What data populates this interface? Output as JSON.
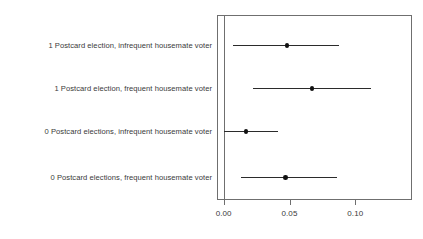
{
  "chart_data": {
    "type": "scatter",
    "title": "",
    "subtitle": "",
    "xlabel": "",
    "ylabel": "",
    "xlim": [
      -0.0051,
      0.1431
    ],
    "grid": false,
    "legend": null,
    "orientation": "horizontal",
    "x_ticks": [
      0.0,
      0.05,
      0.1
    ],
    "x_tick_labels": [
      "0.00",
      "0.05",
      "0.10"
    ],
    "reference_line": 0.0,
    "categories": [
      "1 Postcard election, infrequent housemate voter",
      "1 Postcard election, frequent housemate voter",
      "0 Postcard elections, infrequent housemate voter",
      "0 Postcard elections, frequent housemate voter"
    ],
    "points": [
      {
        "label": "1 Postcard election, infrequent housemate voter",
        "estimate": 0.048,
        "ci_low": 0.007,
        "ci_high": 0.088
      },
      {
        "label": "1 Postcard election, frequent housemate voter",
        "estimate": 0.067,
        "ci_low": 0.022,
        "ci_high": 0.112
      },
      {
        "label": "0 Postcard elections, infrequent housemate voter",
        "estimate": 0.017,
        "ci_low": 0.0,
        "ci_high": 0.041
      },
      {
        "label": "0 Postcard elections, frequent housemate voter",
        "estimate": 0.047,
        "ci_low": 0.013,
        "ci_high": 0.086
      }
    ],
    "colors": {
      "point": "#111111",
      "interval": "#2b2b2b",
      "frame": "#6f6f6f",
      "text": "#3a3a3a",
      "background": "#ffffff"
    }
  }
}
